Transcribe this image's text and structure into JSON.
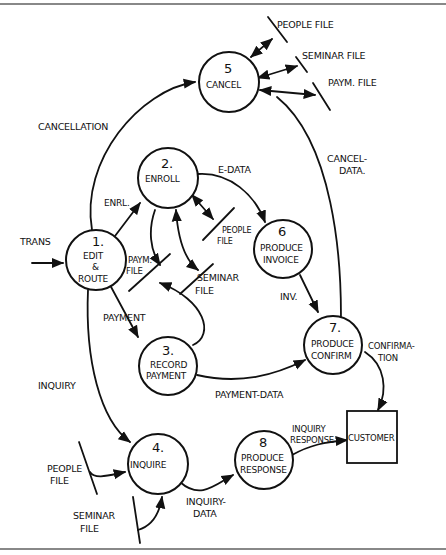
{
  "processes": [
    {
      "id": "1",
      "number": "1.",
      "label_lines": [
        "EDIT",
        "&",
        "ROUTE"
      ]
    },
    {
      "id": "2",
      "number": "2.",
      "label_lines": [
        "ENROLL"
      ]
    },
    {
      "id": "3",
      "number": "3.",
      "label_lines": [
        "RECORD",
        "PAYMENT"
      ]
    },
    {
      "id": "4",
      "number": "4.",
      "label_lines": [
        "INQUIRE"
      ]
    },
    {
      "id": "5",
      "number": "5",
      "label_lines": [
        "CANCEL"
      ]
    },
    {
      "id": "6",
      "number": "6",
      "label_lines": [
        "PRODUCE",
        "INVOICE"
      ]
    },
    {
      "id": "7",
      "number": "7.",
      "label_lines": [
        "PRODUCE",
        "CONFIRM"
      ]
    },
    {
      "id": "8",
      "number": "8",
      "label_lines": [
        "PRODUCE",
        "RESPONSE"
      ]
    }
  ],
  "external_entities": [
    {
      "id": "customer",
      "label": "CUSTOMER"
    }
  ],
  "data_stores": {
    "cancel_people": [
      "PEOPLE FILE"
    ],
    "cancel_seminar": [
      "SEMINAR FILE"
    ],
    "cancel_paym": [
      "PAYM. FILE"
    ],
    "enroll_people": [
      "PEOPLE",
      "FILE"
    ],
    "enroll_seminar": [
      "SEMINAR",
      "FILE"
    ],
    "enroll_paym": [
      "PAYM.",
      "FILE"
    ],
    "inquire_people": [
      "PEOPLE",
      "FILE"
    ],
    "inquire_seminar": [
      "SEMINAR",
      "FILE"
    ]
  },
  "flows": {
    "trans": "TRANS",
    "cancellation": "CANCELLATION",
    "enrl": "ENRL.",
    "e_data": "E-DATA",
    "cancel_data": [
      "CANCEL-",
      "DATA."
    ],
    "payment": "PAYMENT",
    "inv": "INV.",
    "inquiry": "INQUIRY",
    "payment_data": "PAYMENT-DATA",
    "confirmation": [
      "CONFIRMA-",
      "TION"
    ],
    "inquiry_response": [
      "INQUIRY",
      "RESPONSE"
    ],
    "inquiry_data": [
      "INQUIRY-",
      "DATA"
    ]
  }
}
